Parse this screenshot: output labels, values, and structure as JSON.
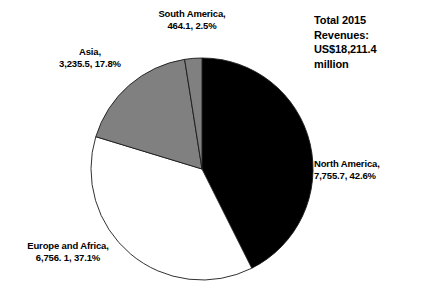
{
  "chart_data": {
    "type": "pie",
    "title": "Total 2015 Revenues: US$18,211.4 million",
    "title_lines": [
      "Total 2015",
      "Revenues:",
      "US$18,211.4",
      "million"
    ],
    "xlabel": "",
    "ylabel": "",
    "grid": false,
    "legend_position": "callout-labels",
    "units": "US$ million",
    "total_value": 18211.4,
    "total_display": "US$18,211.4 million",
    "start_angle_deg": 0,
    "direction": "clockwise",
    "categories": [
      "North America",
      "Europe and Africa",
      "Asia",
      "South America"
    ],
    "values": [
      7755.7,
      6756.1,
      3235.5,
      464.1
    ],
    "percents": [
      42.6,
      37.1,
      17.8,
      2.5
    ],
    "colors": [
      "#000000",
      "#ffffff",
      "#808080",
      "#808080"
    ],
    "slices": [
      {
        "name": "North America",
        "value": 7755.7,
        "value_label": "7,755.7",
        "percent": 42.6,
        "percent_label": "42.6%",
        "color": "#000000",
        "label_line1": "North America,",
        "label_line2": "7,755.7, 42.6%"
      },
      {
        "name": "Europe and Africa",
        "value": 6756.1,
        "value_label": "6,756. 1",
        "percent": 37.1,
        "percent_label": "37.1%",
        "color": "#ffffff",
        "label_line1": "Europe and Africa,",
        "label_line2": "6,756. 1, 37.1%"
      },
      {
        "name": "Asia",
        "value": 3235.5,
        "value_label": "3,235.5",
        "percent": 17.8,
        "percent_label": "17.8%",
        "color": "#808080",
        "label_line1": "Asia,",
        "label_line2": "3,235.5, 17.8%"
      },
      {
        "name": "South America",
        "value": 464.1,
        "value_label": "464.1",
        "percent": 2.5,
        "percent_label": "2.5%",
        "color": "#808080",
        "label_line1": "South America,",
        "label_line2": "464.1, 2.5%"
      }
    ],
    "geometry": {
      "center_x": 202,
      "center_y": 169,
      "radius": 111,
      "stroke_color": "#1a1a1a",
      "stroke_width": 0.9
    }
  }
}
